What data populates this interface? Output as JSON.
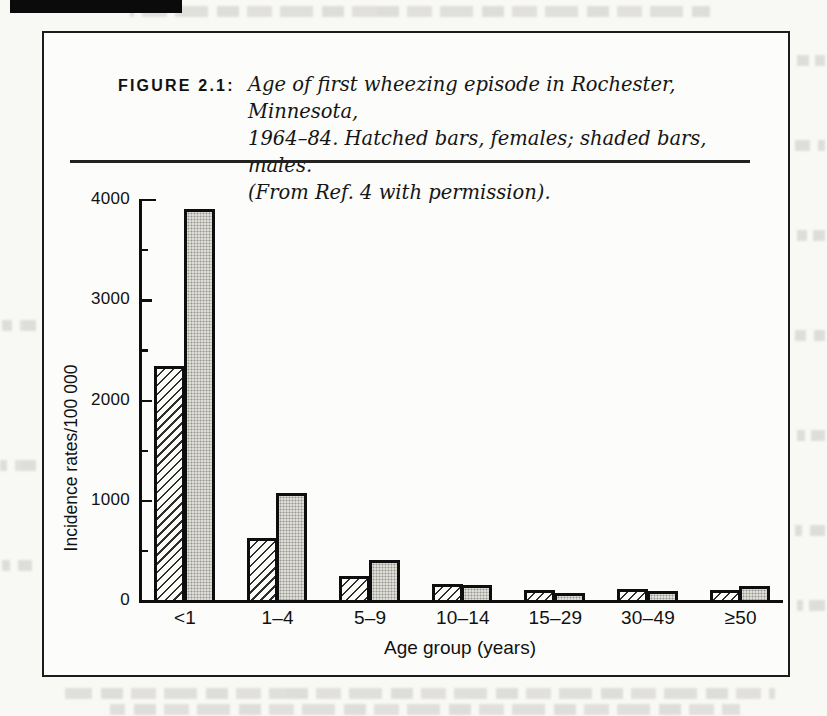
{
  "figure": {
    "label": "FIGURE 2.1:",
    "caption_line1": "Age of first wheezing episode in Rochester, Minnesota,",
    "caption_line2": "1964–84. Hatched bars, females; shaded bars, males.",
    "caption_line3": "(From Ref. 4 with permission)."
  },
  "chart_data": {
    "type": "bar",
    "title": "",
    "xlabel": "Age group (years)",
    "ylabel": "Incidence rates/100 000",
    "categories": [
      "<1",
      "1–4",
      "5–9",
      "10–14",
      "15–29",
      "30–49",
      "≥50"
    ],
    "series": [
      {
        "name": "females",
        "style": "hatched",
        "values": [
          2330,
          620,
          240,
          160,
          100,
          110,
          95
        ]
      },
      {
        "name": "males",
        "style": "shaded",
        "values": [
          3900,
          1070,
          400,
          145,
          70,
          85,
          135
        ]
      }
    ],
    "ylim": [
      0,
      4000
    ],
    "yticks": [
      0,
      1000,
      2000,
      3000,
      4000
    ],
    "minor_tick_interval": 500,
    "grid": false,
    "legend_position": "none"
  }
}
